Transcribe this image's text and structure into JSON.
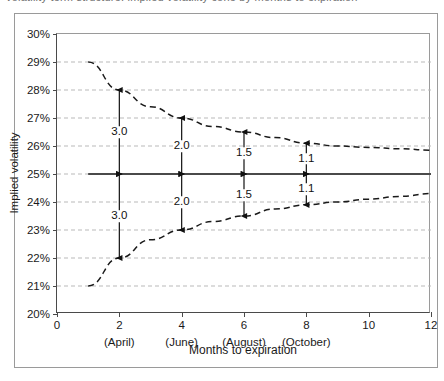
{
  "figure": {
    "top_clipped_text": "volatility term structure: implied volatility cone by months to expiration",
    "frame_color": "#9a9a9a",
    "axis_color": "#4a4a4a",
    "grid_color": "#b9b9b9",
    "curve_color": "#1a1a1a",
    "mean_line_color": "#4a4a4a"
  },
  "chart_data": {
    "type": "line",
    "title": "",
    "xlabel": "Months to expiration",
    "ylabel": "Implied volatility",
    "xlim": [
      0,
      12
    ],
    "ylim": [
      20,
      30
    ],
    "grid": true,
    "legend": "none",
    "x_ticks": [
      0,
      2,
      4,
      6,
      8,
      10,
      12
    ],
    "x_tick_labels": [
      "0",
      "2",
      "4",
      "6",
      "8",
      "10",
      "12"
    ],
    "x_tick_sublabels": [
      "",
      "(April)",
      "(June)",
      "(August)",
      "(October)",
      "",
      ""
    ],
    "y_ticks": [
      20,
      21,
      22,
      23,
      24,
      25,
      26,
      27,
      28,
      29,
      30
    ],
    "y_tick_labels": [
      "20%",
      "21%",
      "22%",
      "23%",
      "24%",
      "25%",
      "26%",
      "27%",
      "28%",
      "29%",
      "30%"
    ],
    "series": [
      {
        "name": "Upper bound",
        "style": "dashed",
        "x": [
          1.0,
          2.0,
          3.0,
          4.0,
          5.0,
          6.0,
          7.0,
          8.0,
          9.0,
          10.0,
          11.0,
          12.0
        ],
        "values": [
          29.0,
          28.0,
          27.4,
          27.0,
          26.7,
          26.5,
          26.3,
          26.1,
          26.0,
          25.95,
          25.9,
          25.85
        ]
      },
      {
        "name": "Lower bound",
        "style": "dashed",
        "x": [
          1.0,
          2.0,
          3.0,
          4.0,
          5.0,
          6.0,
          7.0,
          8.0,
          9.0,
          10.0,
          11.0,
          12.0
        ],
        "values": [
          21.0,
          22.0,
          22.65,
          23.0,
          23.3,
          23.5,
          23.75,
          23.9,
          24.0,
          24.1,
          24.2,
          24.3
        ]
      },
      {
        "name": "Mean implied volatility",
        "style": "solid",
        "x": [
          1.0,
          12.0
        ],
        "values": [
          25.0,
          25.0
        ]
      }
    ],
    "annotations": [
      {
        "x": 2,
        "value": "3.0",
        "side": "upper",
        "from": 25.0,
        "to": 28.0
      },
      {
        "x": 2,
        "value": "3.0",
        "side": "lower",
        "from": 25.0,
        "to": 22.0
      },
      {
        "x": 4,
        "value": "2.0",
        "side": "upper",
        "from": 25.0,
        "to": 27.0
      },
      {
        "x": 4,
        "value": "2.0",
        "side": "lower",
        "from": 25.0,
        "to": 23.0
      },
      {
        "x": 6,
        "value": "1.5",
        "side": "upper",
        "from": 25.0,
        "to": 26.5
      },
      {
        "x": 6,
        "value": "1.5",
        "side": "lower",
        "from": 25.0,
        "to": 23.5
      },
      {
        "x": 8,
        "value": "1.1",
        "side": "upper",
        "from": 25.0,
        "to": 26.1
      },
      {
        "x": 8,
        "value": "1.1",
        "side": "lower",
        "from": 25.0,
        "to": 23.9
      }
    ]
  }
}
